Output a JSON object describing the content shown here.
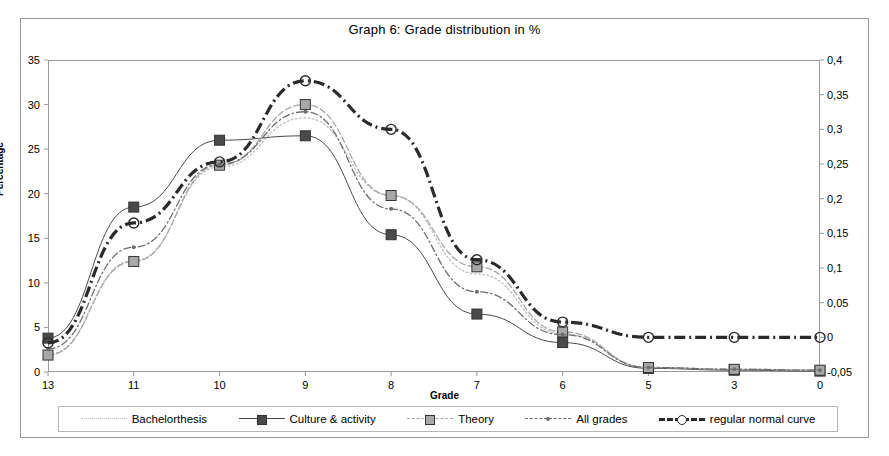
{
  "chart_data": {
    "type": "line",
    "title": "Graph 6: Grade distribution in %",
    "xlabel": "Grade",
    "ylabel": "Percentage",
    "y2label": "",
    "categories": [
      "13",
      "11",
      "10",
      "9",
      "8",
      "7",
      "6",
      "5",
      "3",
      "0"
    ],
    "ylim": [
      0,
      35
    ],
    "yticks": [
      "0",
      "5",
      "10",
      "15",
      "20",
      "25",
      "30",
      "35"
    ],
    "y2lim": [
      -0.05,
      0.4
    ],
    "y2ticks": [
      "-0,05",
      "0",
      "0,05",
      "0,1",
      "0,15",
      "0,2",
      "0,25",
      "0,3",
      "0,35",
      "0,4"
    ],
    "grid": false,
    "legend_position": "bottom",
    "series": [
      {
        "name": "Bachelorthesis",
        "axis": "left",
        "line_style": "dotted",
        "marker": "none",
        "color": "#bdbdbd",
        "values": [
          2.0,
          12.5,
          23.0,
          28.5,
          19.8,
          11.0,
          4.3,
          0.5,
          0.3,
          0.2
        ]
      },
      {
        "name": "Culture & activity",
        "axis": "left",
        "line_style": "solid",
        "marker": "square",
        "color": "#4a4a4a",
        "values": [
          3.8,
          18.5,
          26.0,
          26.5,
          15.4,
          6.5,
          3.3,
          0.4,
          0.2,
          0.1
        ]
      },
      {
        "name": "Theory",
        "axis": "left",
        "line_style": "dashed",
        "marker": "square",
        "color": "#a8a8a8",
        "values": [
          1.9,
          12.4,
          23.2,
          30.0,
          19.8,
          11.8,
          4.5,
          0.5,
          0.3,
          0.2
        ]
      },
      {
        "name": "All grades",
        "axis": "left",
        "line_style": "dash-dot",
        "marker": "dot",
        "color": "#6e6e6e",
        "values": [
          2.6,
          14.0,
          23.3,
          29.2,
          18.3,
          9.0,
          4.2,
          0.5,
          0.3,
          0.2
        ]
      },
      {
        "name": "regular normal curve",
        "axis": "right",
        "line_style": "dash-dot-heavy",
        "marker": "circle",
        "color": "#2a2a2a",
        "values": [
          -0.008,
          0.165,
          0.253,
          0.37,
          0.3,
          0.112,
          0.022,
          0.0,
          0.0,
          0.0
        ]
      }
    ]
  },
  "legend": {
    "items": [
      {
        "label": "Bachelorthesis"
      },
      {
        "label": "Culture & activity"
      },
      {
        "label": "Theory"
      },
      {
        "label": "All grades"
      },
      {
        "label": "regular normal curve"
      }
    ]
  },
  "colors": {
    "frame": "#9a9a9a",
    "background": "#ffffff",
    "text": "#000000"
  }
}
